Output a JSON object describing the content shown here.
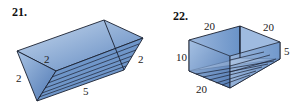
{
  "figures": [
    {
      "number": "21.",
      "shape": "triangular prism",
      "labels": {
        "top_edge": "2",
        "left_edge": "2",
        "right_edge": "2",
        "length": "5"
      }
    },
    {
      "number": "22.",
      "shape": "rectangular box",
      "labels": {
        "top_left_width": "20",
        "top_right_depth": "20",
        "height": "10",
        "right_height": "5",
        "bottom_length": "20"
      }
    }
  ],
  "colors": {
    "fill_light": "#b9cfe6",
    "fill_dark": "#5f87bd",
    "stroke": "#1a2030"
  }
}
